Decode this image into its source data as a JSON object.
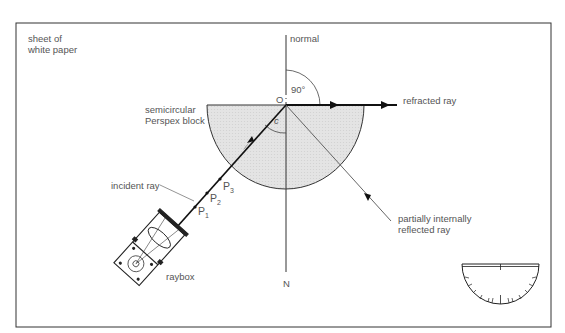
{
  "labels": {
    "paper": [
      "sheet of",
      "white paper"
    ],
    "normal": "normal",
    "angle_90": "90°",
    "origin": "O",
    "critical_angle": "c",
    "block": [
      "semicircular",
      "Perspex block"
    ],
    "refracted": "refracted ray",
    "incident": "incident ray",
    "p1": "P",
    "p1_sub": "1",
    "p2": "P",
    "p2_sub": "2",
    "p3": "P",
    "p3_sub": "3",
    "reflected": [
      "partially internally",
      "reflected ray"
    ],
    "normal_end": "N",
    "raybox": "raybox"
  },
  "colors": {
    "block_fill": "#e6e6e6",
    "line": "#222222",
    "text": "#555555"
  }
}
